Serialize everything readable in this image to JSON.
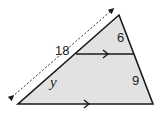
{
  "diagram": {
    "type": "triangle-with-parallel-segment",
    "fill_color": "#e2e2e2",
    "stroke_color": "#1a1a1a",
    "vertices": {
      "apex": [
        119,
        15
      ],
      "bottom_left": [
        18,
        104
      ],
      "bottom_right": [
        153,
        104
      ]
    },
    "parallel_segment": {
      "from": [
        76,
        54
      ],
      "to": [
        134,
        54
      ]
    },
    "dimension_line": {
      "from": [
        12,
        97
      ],
      "to": [
        112,
        10
      ],
      "style": "dashed-double-arrow"
    },
    "labels": {
      "left_side_total": "18",
      "right_upper": "6",
      "left_lower": "y",
      "right_lower": "9"
    }
  }
}
